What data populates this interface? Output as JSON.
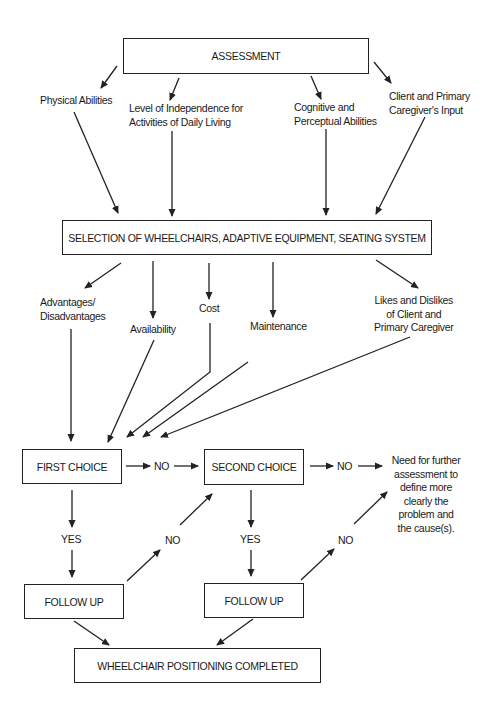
{
  "diagram": {
    "boxes": {
      "assessment": "ASSESSMENT",
      "selection": "SELECTION OF WHEELCHAIRS, ADAPTIVE EQUIPMENT, SEATING SYSTEM",
      "first_choice": "FIRST CHOICE",
      "second_choice": "SECOND CHOICE",
      "follow_up_1": "FOLLOW UP",
      "follow_up_2": "FOLLOW UP",
      "completed": "WHEELCHAIR POSITIONING COMPLETED"
    },
    "assessment_factors": [
      {
        "line1": "Physical Abilities",
        "line2": ""
      },
      {
        "line1": "Level of Independence for",
        "line2": "Activities of Daily Living"
      },
      {
        "line1": "Cognitive and",
        "line2": "Perceptual Abilities"
      },
      {
        "line1": "Client and Primary",
        "line2": "Caregiver's Input"
      }
    ],
    "selection_factors": [
      {
        "line1": "Advantages/",
        "line2": "Disadvantages",
        "line3": ""
      },
      {
        "line1": "Availability",
        "line2": "",
        "line3": ""
      },
      {
        "line1": "Cost",
        "line2": "",
        "line3": ""
      },
      {
        "line1": "Maintenance",
        "line2": "",
        "line3": ""
      },
      {
        "line1": "Likes and Dislikes",
        "line2": "of Client and",
        "line3": "Primary Caregiver"
      }
    ],
    "decision_labels": {
      "first_no": "NO",
      "second_no": "NO",
      "first_yes": "YES",
      "second_yes": "YES",
      "follow1_no": "NO",
      "follow2_no": "NO"
    },
    "further_assessment": [
      "Need for further",
      "assessment to",
      "define more",
      "clearly the",
      "problem and",
      "the cause(s)."
    ]
  }
}
